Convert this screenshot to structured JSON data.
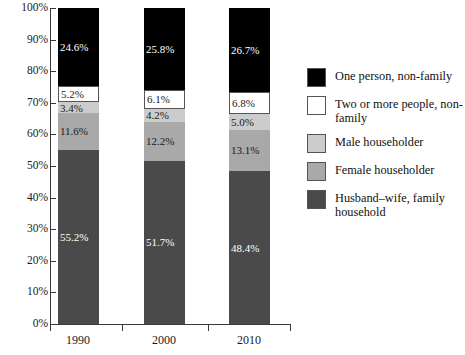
{
  "chart_data": {
    "type": "bar",
    "subtype": "stacked-percent-vertical",
    "title": "",
    "xlabel": "",
    "ylabel": "",
    "categories": [
      "1990",
      "2000",
      "2010"
    ],
    "ylim": [
      0,
      100
    ],
    "y_ticks": [
      "0%",
      "10%",
      "20%",
      "30%",
      "40%",
      "50%",
      "60%",
      "70%",
      "80%",
      "90%",
      "100%"
    ],
    "y_tick_values": [
      0,
      10,
      20,
      30,
      40,
      50,
      60,
      70,
      80,
      90,
      100
    ],
    "grid": false,
    "legend_position": "right",
    "stack_order_bottom_to_top": [
      "Husband–wife, family household",
      "Female householder",
      "Male householder",
      "Two or more people, non-family",
      "One person, non-family"
    ],
    "series": [
      {
        "name": "One person, non-family",
        "color": "#000000",
        "label_color": "#ffffff",
        "values": [
          24.6,
          25.8,
          26.7
        ],
        "labels": [
          "24.6%",
          "25.8%",
          "26.7%"
        ]
      },
      {
        "name": "Two or more people, non-family",
        "color": "#ffffff",
        "label_color": "#1a1a1a",
        "values": [
          5.2,
          6.1,
          6.8
        ],
        "labels": [
          "5.2%",
          "6.1%",
          "6.8%"
        ]
      },
      {
        "name": "Male householder",
        "color": "#cccccc",
        "label_color": "#1a1a1a",
        "values": [
          3.4,
          4.2,
          5.0
        ],
        "labels": [
          "3.4%",
          "4.2%",
          "5.0%"
        ]
      },
      {
        "name": "Female householder",
        "color": "#a9a9a9",
        "label_color": "#1a1a1a",
        "values": [
          11.6,
          12.2,
          13.1
        ],
        "labels": [
          "11.6%",
          "12.2%",
          "13.1%"
        ]
      },
      {
        "name": "Husband–wife, family household",
        "color": "#4a4a4a",
        "label_color": "#ffffff",
        "values": [
          55.2,
          51.7,
          48.4
        ],
        "labels": [
          "55.2%",
          "51.7%",
          "48.4%"
        ]
      }
    ]
  },
  "axis": {
    "y_labels": [
      "100%",
      "90%",
      "80%",
      "70%",
      "60%",
      "50%",
      "40%",
      "30%",
      "20%",
      "10%",
      "0%"
    ],
    "x_labels": [
      "1990",
      "2000",
      "2010"
    ]
  },
  "legend": {
    "items": [
      {
        "label": "One person, non-family",
        "color": "#000000"
      },
      {
        "label": "Two or more people, non-family",
        "color": "#ffffff"
      },
      {
        "label": "Male householder",
        "color": "#cccccc"
      },
      {
        "label": "Female householder",
        "color": "#a9a9a9"
      },
      {
        "label": "Husband–wife, family household",
        "color": "#4a4a4a"
      }
    ]
  },
  "bar_segment_labels": {
    "b1": [
      "24.6%",
      "5.2%",
      "3.4%",
      "11.6%",
      "55.2%"
    ],
    "b2": [
      "25.8%",
      "6.1%",
      "4.2%",
      "12.2%",
      "51.7%"
    ],
    "b3": [
      "26.7%",
      "6.8%",
      "5.0%",
      "13.1%",
      "48.4%"
    ]
  }
}
